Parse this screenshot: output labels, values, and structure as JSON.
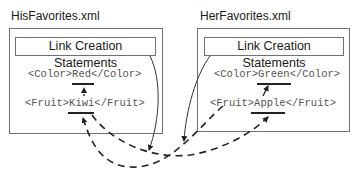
{
  "left_file": {
    "title": "HisFavorites.xml",
    "link_box_label": "Link Creation Statements",
    "color_open": "<Color>",
    "color_value": "Red",
    "color_close": "</Color>",
    "fruit_open": "<Fruit>",
    "fruit_value": "Kiwi",
    "fruit_close": "</Fruit>"
  },
  "right_file": {
    "title": "HerFavorites.xml",
    "link_box_label": "Link Creation Statements",
    "color_open": "<Color>",
    "color_value": "Green",
    "color_close": "</Color>",
    "fruit_open": "<Fruit>",
    "fruit_value": "Apple",
    "fruit_close": "</Fruit>"
  },
  "colors": {
    "line": "#222222",
    "box_border": "#707070",
    "code_text": "#555555"
  }
}
